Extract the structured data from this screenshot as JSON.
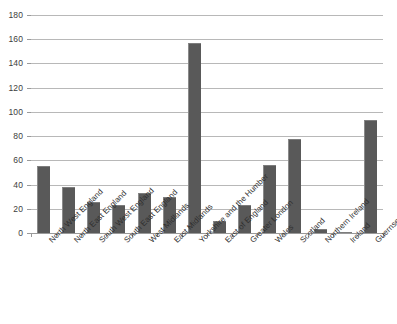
{
  "chart_data": {
    "type": "bar",
    "title": "",
    "subtitle": "",
    "xlabel": "",
    "ylabel": "",
    "ylim": [
      0,
      180
    ],
    "ytick_step": 20,
    "yticks": [
      0,
      20,
      40,
      60,
      80,
      100,
      120,
      140,
      160,
      180
    ],
    "grid": true,
    "legend": null,
    "bar_color": "#595959",
    "gridline_color": "#b8b8b8",
    "background_color": "#ffffff",
    "categories": [
      "North West England",
      "North East England",
      "South West England",
      "South East England",
      "West Midlands",
      "East Midlands",
      "Yorkshire and the Humber",
      "East of England",
      "Greater London",
      "Wales",
      "Scotland",
      "Northern Ireland",
      "Ireland",
      "Guernsey"
    ],
    "values": [
      55,
      38,
      26,
      23,
      33,
      30,
      157,
      10,
      23,
      56,
      78,
      3,
      1,
      93
    ]
  }
}
